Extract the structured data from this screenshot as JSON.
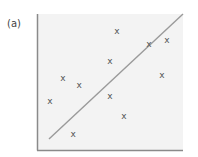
{
  "panel_label": "(a)",
  "colors": {
    "plot_bg": "#f3f3f3",
    "axis": "#8a8a8a",
    "line": "#9a9a9a",
    "marker": "#555555"
  },
  "chart_data": {
    "type": "scatter",
    "title": "",
    "xlabel": "",
    "ylabel": "",
    "xlim": [
      0,
      10
    ],
    "ylim": [
      0,
      10
    ],
    "grid": false,
    "legend": null,
    "marker": "x",
    "points": [
      {
        "x": 5.48,
        "y": 8.75
      },
      {
        "x": 7.67,
        "y": 7.79
      },
      {
        "x": 8.9,
        "y": 8.09
      },
      {
        "x": 5.0,
        "y": 6.54
      },
      {
        "x": 8.56,
        "y": 5.51
      },
      {
        "x": 1.78,
        "y": 5.29
      },
      {
        "x": 2.88,
        "y": 4.78
      },
      {
        "x": 0.89,
        "y": 3.6
      },
      {
        "x": 5.0,
        "y": 3.97
      },
      {
        "x": 5.96,
        "y": 2.5
      },
      {
        "x": 2.47,
        "y": 1.18
      }
    ],
    "fit_line": {
      "x1": 0.82,
      "y1": 0.81,
      "x2": 10,
      "y2": 10
    }
  }
}
